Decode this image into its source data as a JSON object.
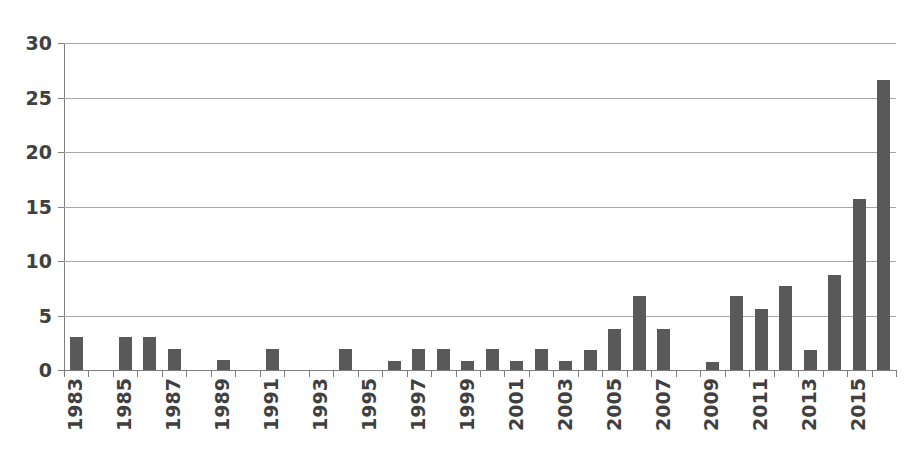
{
  "chart_data": {
    "type": "bar",
    "title": "",
    "subtitle": "",
    "xlabel": "",
    "ylabel": "",
    "ylim": [
      0,
      30
    ],
    "y_ticks": [
      0,
      5,
      10,
      15,
      20,
      25,
      30
    ],
    "grid": true,
    "legend": false,
    "legend_position": "none",
    "bar_color": "#595959",
    "gridline_color": "#a6a6a6",
    "axis_color": "#7f7f7f",
    "tick_label_color": "#404040",
    "x_tick_labels": [
      "1983",
      "1985",
      "1987",
      "1989",
      "1991",
      "1993",
      "1995",
      "1997",
      "1999",
      "2001",
      "2003",
      "2005",
      "2007",
      "2009",
      "2011",
      "2013",
      "2015"
    ],
    "x_tick_label_interval": 2,
    "categories": [
      "1983",
      "1984",
      "1985",
      "1986",
      "1987",
      "1988",
      "1989",
      "1990",
      "1991",
      "1992",
      "1993",
      "1994",
      "1995",
      "1996",
      "1997",
      "1998",
      "1999",
      "2000",
      "2001",
      "2002",
      "2003",
      "2004",
      "2005",
      "2006",
      "2007",
      "2008",
      "2009",
      "2010",
      "2011",
      "2012",
      "2013",
      "2014",
      "2015",
      "2016"
    ],
    "values": [
      3.0,
      0,
      3.0,
      3.0,
      1.9,
      0,
      0.9,
      0,
      1.9,
      0,
      0,
      1.9,
      0,
      0.8,
      1.9,
      1.9,
      0.8,
      1.9,
      0.8,
      1.9,
      0.8,
      1.8,
      3.8,
      6.8,
      3.8,
      0,
      0.7,
      6.8,
      5.6,
      7.7,
      1.8,
      8.7,
      15.7,
      26.6
    ]
  }
}
